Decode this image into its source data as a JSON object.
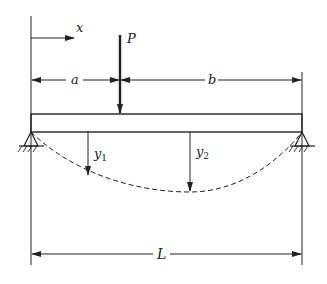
{
  "diagram": {
    "type": "simply-supported beam with point load",
    "labels": {
      "load": "P",
      "x_axis": "x",
      "dist_a": "a",
      "dist_b": "b",
      "deflection_1": "y",
      "deflection_1_sub": "1",
      "deflection_2": "y",
      "deflection_2_sub": "2",
      "length": "L"
    },
    "colors": {
      "ink": "#222222",
      "background": "#ffffff"
    }
  }
}
